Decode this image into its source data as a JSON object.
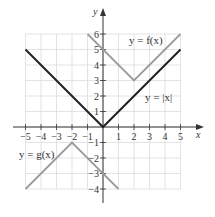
{
  "chart_data": {
    "type": "line",
    "title": "",
    "xlabel": "x",
    "ylabel": "y",
    "xlim": [
      -5,
      5
    ],
    "ylim": [
      -4,
      6
    ],
    "grid": true,
    "x_ticks": [
      -5,
      -4,
      -3,
      -2,
      -1,
      1,
      2,
      3,
      4,
      5
    ],
    "y_ticks": [
      6,
      5,
      4,
      3,
      2,
      1,
      -1,
      -2,
      -3,
      -4
    ],
    "series": [
      {
        "name": "y = |x|",
        "color": "#222222",
        "points": [
          [
            -5,
            5
          ],
          [
            0,
            0
          ],
          [
            5,
            5
          ]
        ]
      },
      {
        "name": "y = f(x)",
        "color": "#9a9a9a",
        "points": [
          [
            -1,
            6
          ],
          [
            2,
            3
          ],
          [
            5,
            6
          ]
        ]
      },
      {
        "name": "y = g(x)",
        "color": "#9a9a9a",
        "points": [
          [
            -5,
            -4
          ],
          [
            -2,
            -1
          ],
          [
            1,
            -4
          ]
        ]
      }
    ],
    "annotations": [
      {
        "text": "y = f(x)",
        "x": 2.5,
        "y": 5.5
      },
      {
        "text": "y = |x|",
        "x": 3.8,
        "y": 1.8
      },
      {
        "text": "y = g(x)",
        "x": -4.3,
        "y": -1.6
      }
    ]
  },
  "labels": {
    "x_axis": "x",
    "y_axis": "y",
    "f_label": "y = f(x)",
    "abs_label": "y = |x|",
    "g_label": "y = g(x)"
  }
}
